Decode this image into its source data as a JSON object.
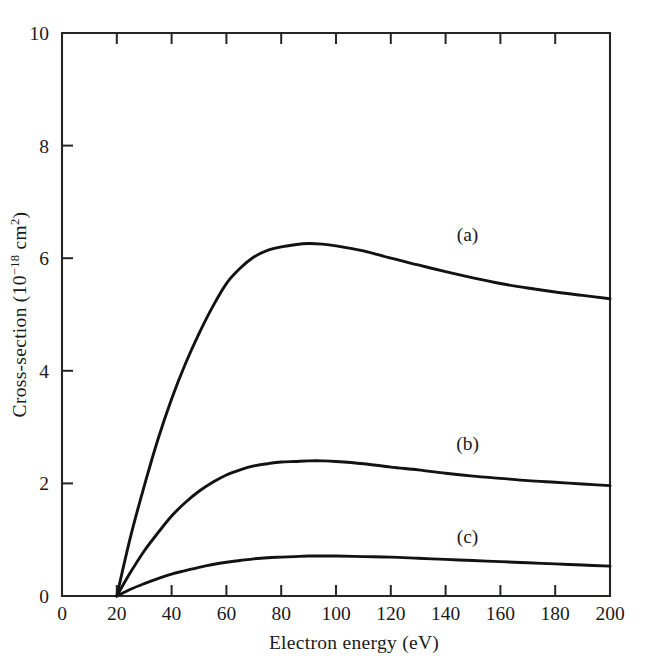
{
  "chart_data": {
    "type": "line",
    "title": "",
    "xlabel": "Electron energy (eV)",
    "ylabel": "Cross-section (10⁻¹⁸ cm²)",
    "ylabel_parts": {
      "prefix": "Cross-section (10",
      "exponent": "−18",
      "middle": " cm",
      "exponent2": "2",
      "suffix": ")"
    },
    "xlim": [
      0,
      200
    ],
    "ylim": [
      0,
      10
    ],
    "xticks": [
      0,
      20,
      40,
      60,
      80,
      100,
      120,
      140,
      160,
      180,
      200
    ],
    "xtick_labels": [
      "0",
      "20",
      "40",
      "60",
      "80",
      "100",
      "120",
      "140",
      "160",
      "180",
      "200"
    ],
    "yticks": [
      0,
      2,
      4,
      6,
      8,
      10
    ],
    "ytick_labels": [
      "0",
      "2",
      "4",
      "6",
      "8",
      "10"
    ],
    "grid": false,
    "legend_position": "inline-annotations",
    "series": [
      {
        "name": "(a)",
        "label": "(a)",
        "annotation_x": 148,
        "annotation_y": 6.3,
        "x": [
          20,
          25,
          30,
          35,
          40,
          45,
          50,
          55,
          60,
          65,
          70,
          75,
          80,
          85,
          90,
          95,
          100,
          110,
          120,
          130,
          140,
          150,
          160,
          170,
          180,
          190,
          200
        ],
        "y": [
          0.0,
          1.05,
          1.95,
          2.78,
          3.5,
          4.12,
          4.66,
          5.14,
          5.55,
          5.82,
          6.02,
          6.14,
          6.2,
          6.24,
          6.26,
          6.25,
          6.22,
          6.13,
          6.0,
          5.88,
          5.76,
          5.65,
          5.55,
          5.47,
          5.4,
          5.34,
          5.28
        ]
      },
      {
        "name": "(b)",
        "label": "(b)",
        "annotation_x": 148,
        "annotation_y": 2.6,
        "x": [
          20,
          25,
          30,
          35,
          40,
          45,
          50,
          55,
          60,
          65,
          70,
          75,
          80,
          85,
          90,
          95,
          100,
          110,
          120,
          130,
          140,
          150,
          160,
          170,
          180,
          190,
          200
        ],
        "y": [
          0.0,
          0.42,
          0.8,
          1.12,
          1.42,
          1.66,
          1.86,
          2.02,
          2.15,
          2.24,
          2.31,
          2.35,
          2.38,
          2.39,
          2.4,
          2.4,
          2.39,
          2.35,
          2.29,
          2.24,
          2.18,
          2.13,
          2.09,
          2.05,
          2.02,
          1.99,
          1.96
        ]
      },
      {
        "name": "(c)",
        "label": "(c)",
        "annotation_x": 148,
        "annotation_y": 0.95,
        "x": [
          20,
          25,
          30,
          35,
          40,
          45,
          50,
          55,
          60,
          65,
          70,
          75,
          80,
          85,
          90,
          95,
          100,
          110,
          120,
          130,
          140,
          150,
          160,
          170,
          180,
          190,
          200
        ],
        "y": [
          0.0,
          0.12,
          0.22,
          0.31,
          0.39,
          0.45,
          0.51,
          0.56,
          0.6,
          0.63,
          0.66,
          0.68,
          0.69,
          0.7,
          0.71,
          0.71,
          0.71,
          0.7,
          0.69,
          0.67,
          0.65,
          0.63,
          0.61,
          0.59,
          0.57,
          0.55,
          0.53
        ]
      }
    ]
  },
  "style": {
    "axis_color": "#262626",
    "curve_color": "#121212",
    "text_color": "#1a1a1a",
    "background": "#ffffff"
  }
}
